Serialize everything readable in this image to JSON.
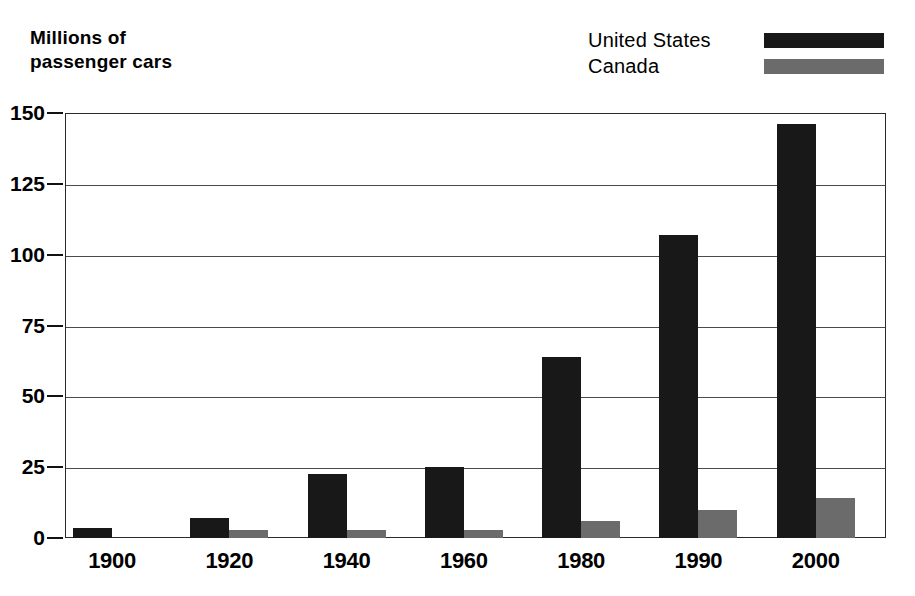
{
  "y_axis_caption": "Millions of\npassenger cars",
  "legend": {
    "items": [
      {
        "label": "United States",
        "color": "#181818",
        "swatch_name": "legend-swatch-united-states"
      },
      {
        "label": "Canada",
        "color": "#6b6b6b",
        "swatch_name": "legend-swatch-canada"
      }
    ]
  },
  "chart_data": {
    "type": "bar",
    "title": "",
    "subtitle": "",
    "xlabel": "",
    "ylabel": "Millions of passenger cars",
    "categories": [
      "1900",
      "1920",
      "1940",
      "1960",
      "1980",
      "1990",
      "2000"
    ],
    "series": [
      {
        "name": "United States",
        "color": "#181818",
        "values": [
          3.5,
          7,
          22.5,
          25,
          64,
          107,
          146
        ]
      },
      {
        "name": "Canada",
        "color": "#6b6b6b",
        "values": [
          0,
          3,
          3,
          3,
          6,
          10,
          14
        ]
      }
    ],
    "ylim": [
      0,
      150
    ],
    "yticks": [
      0,
      25,
      50,
      75,
      100,
      125,
      150
    ],
    "ytick_labels": [
      "0",
      "25",
      "50",
      "75",
      "100",
      "125",
      "150"
    ],
    "grid": true,
    "grid_axis": "y",
    "legend_position": "top-right",
    "bar_group_mode": "grouped"
  }
}
